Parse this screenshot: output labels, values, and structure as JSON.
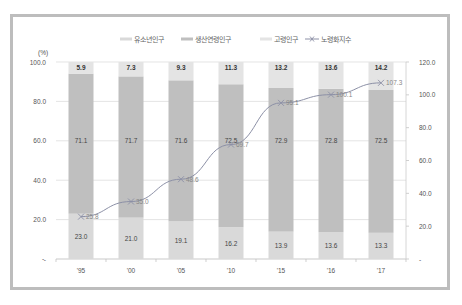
{
  "chart_data": {
    "type": "bar",
    "stacked": true,
    "categories": [
      "'95",
      "'00",
      "'05",
      "'10",
      "'15",
      "'16",
      "'17"
    ],
    "series": [
      {
        "name": "유소년인구",
        "type": "bar",
        "axis": "left",
        "color": "#d9d9d9",
        "values": [
          23.0,
          21.0,
          19.1,
          16.2,
          13.9,
          13.6,
          13.3
        ]
      },
      {
        "name": "생산연령인구",
        "type": "bar",
        "axis": "left",
        "color": "#bfbfbf",
        "values": [
          71.1,
          71.7,
          71.6,
          72.5,
          72.9,
          72.8,
          72.5
        ]
      },
      {
        "name": "고령인구",
        "type": "bar",
        "axis": "left",
        "color": "#e4e4e4",
        "values": [
          5.9,
          7.3,
          9.3,
          11.3,
          13.2,
          13.6,
          14.2
        ]
      },
      {
        "name": "노령화지수",
        "type": "line",
        "axis": "right",
        "color": "#8c90a6",
        "marker": "x",
        "values": [
          25.8,
          35.0,
          48.6,
          69.7,
          95.1,
          100.1,
          107.3
        ]
      }
    ],
    "ylabel": "(%)",
    "ylim": [
      0,
      100
    ],
    "y_ticks": [
      "-",
      "20.0",
      "40.0",
      "60.0",
      "80.0",
      "100.0"
    ],
    "y2lim": [
      0,
      120
    ],
    "y2_ticks": [
      "-",
      "20.0",
      "40.0",
      "60.0",
      "80.0",
      "100.0",
      "120.0"
    ],
    "grid": true,
    "legend_position": "top"
  },
  "legend": {
    "items": [
      "유소년인구",
      "생산연령인구",
      "고령인구",
      "노령화지수"
    ]
  },
  "axis": {
    "unit": "(%)",
    "left_ticks": [
      "-",
      "20.0",
      "40.0",
      "60.0",
      "80.0",
      "100.0"
    ],
    "right_ticks": [
      "-",
      "20.0",
      "40.0",
      "60.0",
      "80.0",
      "100.0",
      "120.0"
    ]
  }
}
